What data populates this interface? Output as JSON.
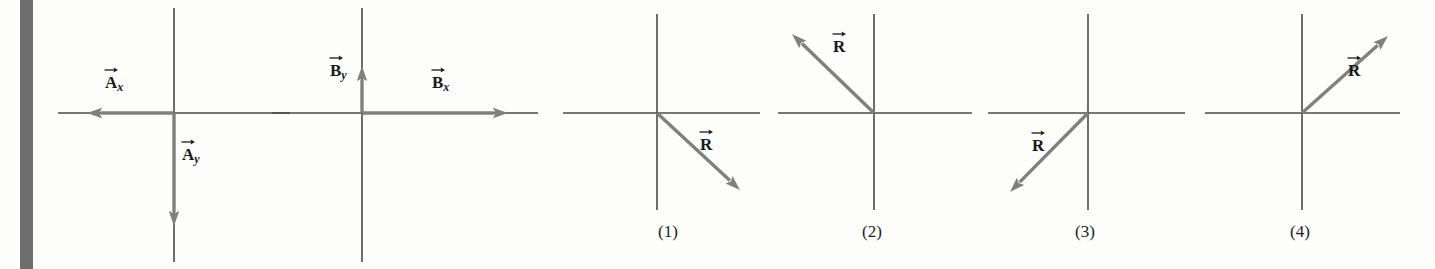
{
  "figure": {
    "type": "vector-diagram",
    "background_color": "#fdfdfc",
    "axis_color": "#4a4a4a",
    "vector_color": "#808080",
    "label_color": "#1a1a1a",
    "margin_bar_color": "#6e6e6e"
  },
  "panels": [
    {
      "id": "panel-a",
      "name": "vector-a-components",
      "origin": {
        "x": 174,
        "y": 113
      },
      "axes": {
        "x_start": 58,
        "x_end": 290,
        "y_start": 8,
        "y_end": 262
      },
      "vectors": [
        {
          "name": "A-x-component",
          "label_letter": "A",
          "label_subscript": "x",
          "from": {
            "x": 174,
            "y": 113
          },
          "to": {
            "x": 87,
            "y": 113
          },
          "direction": "left",
          "label_pos": {
            "x": 105,
            "y": 74
          }
        },
        {
          "name": "A-y-component",
          "label_letter": "A",
          "label_subscript": "y",
          "from": {
            "x": 174,
            "y": 113
          },
          "to": {
            "x": 174,
            "y": 226
          },
          "direction": "down",
          "label_pos": {
            "x": 182,
            "y": 146
          }
        }
      ]
    },
    {
      "id": "panel-b",
      "name": "vector-b-components",
      "origin": {
        "x": 362,
        "y": 113
      },
      "axes": {
        "x_start": 272,
        "x_end": 538,
        "y_start": 8,
        "y_end": 262
      },
      "vectors": [
        {
          "name": "B-y-component",
          "label_letter": "B",
          "label_subscript": "y",
          "from": {
            "x": 362,
            "y": 113
          },
          "to": {
            "x": 362,
            "y": 66
          },
          "direction": "up",
          "label_pos": {
            "x": 330,
            "y": 62
          }
        },
        {
          "name": "B-x-component",
          "label_letter": "B",
          "label_subscript": "x",
          "from": {
            "x": 362,
            "y": 113
          },
          "to": {
            "x": 508,
            "y": 113
          },
          "direction": "right",
          "label_pos": {
            "x": 432,
            "y": 74
          }
        }
      ]
    }
  ],
  "options": [
    {
      "id": "option-1",
      "name": "resultant-option-1",
      "label": "(1)",
      "label_pos": {
        "x": 668,
        "y": 222
      },
      "origin": {
        "x": 657,
        "y": 113
      },
      "axes": {
        "x_start": 563,
        "x_end": 760,
        "y_start": 14,
        "y_end": 210
      },
      "vector": {
        "name": "R-vector",
        "label_letter": "R",
        "label_subscript": "",
        "from": {
          "x": 657,
          "y": 113
        },
        "to": {
          "x": 740,
          "y": 190
        },
        "quadrant": 4,
        "angle_deg": -43,
        "label_pos": {
          "x": 700,
          "y": 136
        }
      }
    },
    {
      "id": "option-2",
      "name": "resultant-option-2",
      "label": "(2)",
      "label_pos": {
        "x": 872,
        "y": 222
      },
      "origin": {
        "x": 874,
        "y": 113
      },
      "axes": {
        "x_start": 778,
        "x_end": 972,
        "y_start": 14,
        "y_end": 210
      },
      "vector": {
        "name": "R-vector",
        "label_letter": "R",
        "label_subscript": "",
        "from": {
          "x": 874,
          "y": 113
        },
        "to": {
          "x": 792,
          "y": 34
        },
        "quadrant": 2,
        "angle_deg": 136,
        "label_pos": {
          "x": 833,
          "y": 38
        }
      }
    },
    {
      "id": "option-3",
      "name": "resultant-option-3",
      "label": "(3)",
      "label_pos": {
        "x": 1085,
        "y": 222
      },
      "origin": {
        "x": 1088,
        "y": 113
      },
      "axes": {
        "x_start": 988,
        "x_end": 1185,
        "y_start": 14,
        "y_end": 210
      },
      "vector": {
        "name": "R-vector",
        "label_letter": "R",
        "label_subscript": "",
        "from": {
          "x": 1088,
          "y": 113
        },
        "to": {
          "x": 1010,
          "y": 192
        },
        "quadrant": 3,
        "angle_deg": -135,
        "label_pos": {
          "x": 1032,
          "y": 137
        }
      }
    },
    {
      "id": "option-4",
      "name": "resultant-option-4",
      "label": "(4)",
      "label_pos": {
        "x": 1300,
        "y": 222
      },
      "origin": {
        "x": 1302,
        "y": 113
      },
      "axes": {
        "x_start": 1205,
        "x_end": 1400,
        "y_start": 14,
        "y_end": 210
      },
      "vector": {
        "name": "R-vector",
        "label_letter": "R",
        "label_subscript": "",
        "from": {
          "x": 1302,
          "y": 113
        },
        "to": {
          "x": 1388,
          "y": 36
        },
        "quadrant": 1,
        "angle_deg": 42,
        "label_pos": {
          "x": 1348,
          "y": 62
        }
      }
    }
  ]
}
